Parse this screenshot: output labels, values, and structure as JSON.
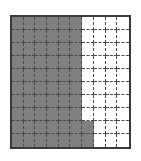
{
  "figure": {
    "border_color": "#3a3a3a",
    "gridline_color": "#4a4a4a",
    "shaded_color": "#808080",
    "unshaded_color": "#ffffff",
    "background_color": "#ffffff"
  },
  "chart_data": {
    "type": "heatmap",
    "xlabel": "",
    "ylabel": "",
    "rows": 10,
    "columns": 10,
    "total_cells": 100,
    "shaded_cells": 67,
    "unshaded_cells": 33,
    "shaded_fraction": "67/100",
    "shaded_decimal": 0.67,
    "shaded_percent": 67,
    "legend": [
      {
        "label": "Shaded",
        "color": "#808080",
        "count": 67
      },
      {
        "label": "Unshaded",
        "color": "#ffffff",
        "count": 33
      }
    ],
    "row_shaded_counts": [
      6,
      6,
      6,
      6,
      6,
      6,
      6,
      6,
      7,
      7
    ],
    "grid": [
      [
        1,
        1,
        1,
        1,
        1,
        1,
        0,
        0,
        0,
        0
      ],
      [
        1,
        1,
        1,
        1,
        1,
        1,
        0,
        0,
        0,
        0
      ],
      [
        1,
        1,
        1,
        1,
        1,
        1,
        0,
        0,
        0,
        0
      ],
      [
        1,
        1,
        1,
        1,
        1,
        1,
        0,
        0,
        0,
        0
      ],
      [
        1,
        1,
        1,
        1,
        1,
        1,
        0,
        0,
        0,
        0
      ],
      [
        1,
        1,
        1,
        1,
        1,
        1,
        0,
        0,
        0,
        0
      ],
      [
        1,
        1,
        1,
        1,
        1,
        1,
        0,
        0,
        0,
        0
      ],
      [
        1,
        1,
        1,
        1,
        1,
        1,
        0,
        0,
        0,
        0
      ],
      [
        1,
        1,
        1,
        1,
        1,
        1,
        1,
        0,
        0,
        0
      ],
      [
        1,
        1,
        1,
        1,
        1,
        1,
        1,
        0,
        0,
        0
      ]
    ]
  }
}
